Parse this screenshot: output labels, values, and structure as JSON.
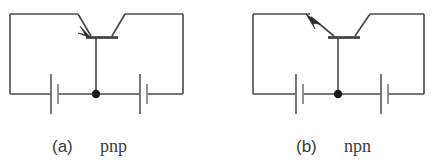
{
  "figure": {
    "background_color": "#ffffff",
    "line_color": "#4a4a4a",
    "text_color": "#3a3a3a",
    "panels": [
      {
        "id": "a",
        "label": "(a)",
        "type": "pnp",
        "description": "pnp bipolar junction transistor biasing circuit with two batteries",
        "arrow_direction": "into-base",
        "components": {
          "transistor_label": "pnp-transistor",
          "battery_left_label": "battery",
          "battery_right_label": "battery",
          "junction_label": "base-node"
        }
      },
      {
        "id": "b",
        "label": "(b)",
        "type": "npn",
        "description": "npn bipolar junction transistor biasing circuit with two batteries",
        "arrow_direction": "out-of-base",
        "components": {
          "transistor_label": "npn-transistor",
          "battery_left_label": "battery",
          "battery_right_label": "battery",
          "junction_label": "base-node"
        }
      }
    ]
  }
}
